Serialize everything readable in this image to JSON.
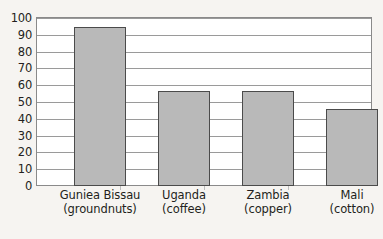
{
  "chart_data": {
    "type": "bar",
    "title": "",
    "subtitle": "",
    "xlabel": "",
    "ylabel": "",
    "ylim": [
      0,
      100
    ],
    "ytick_step": 10,
    "yticks": [
      "0",
      "10",
      "20",
      "30",
      "40",
      "50",
      "60",
      "70",
      "80",
      "90",
      "100"
    ],
    "grid": true,
    "legend": false,
    "legend_position": "none",
    "categories": [
      "Guniea Bissau (groundnuts)",
      "Uganda (coffee)",
      "Zambia (copper)",
      "Mali (cotton)"
    ],
    "category_lines": [
      {
        "line1": "Guniea Bissau",
        "line2": "(groundnuts)"
      },
      {
        "line1": "Uganda",
        "line2": "(coffee)"
      },
      {
        "line1": "Zambia",
        "line2": "(copper)"
      },
      {
        "line1": "Mali",
        "line2": "(cotton)"
      }
    ],
    "values": [
      94,
      56.5,
      56.5,
      45.5
    ],
    "colors": {
      "bar_fill": "#b9b9b9",
      "bar_border": "#4b4b4b",
      "gridline": "#9a9a9a",
      "frame": "#8a8a8a",
      "plot_background": "#ffffff",
      "page_background": "#f6f4f1",
      "text": "#231f20"
    }
  }
}
